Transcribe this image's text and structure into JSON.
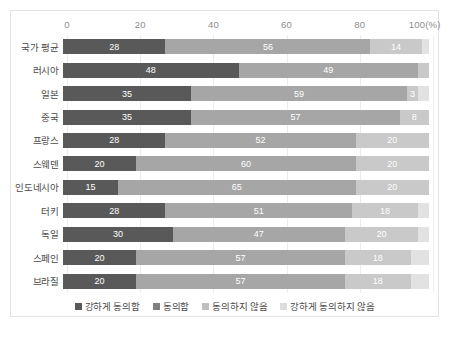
{
  "chart_data": {
    "type": "bar",
    "subtype": "stacked-horizontal-100",
    "title": "",
    "xlabel": "",
    "ylabel": "",
    "xlim": [
      0,
      100
    ],
    "ticks": [
      "0",
      "20",
      "40",
      "60",
      "80",
      "100(%)"
    ],
    "tick_values": [
      0,
      20,
      40,
      60,
      80,
      100
    ],
    "grid": true,
    "legend_position": "bottom",
    "categories": [
      "국가 평균",
      "러시아",
      "일본",
      "중국",
      "프랑스",
      "스웨덴",
      "인도네시아",
      "터키",
      "독일",
      "스페인",
      "브라질"
    ],
    "series": [
      {
        "name": "강하게 동의함",
        "color": "#595959",
        "values": [
          28,
          48,
          35,
          35,
          28,
          20,
          15,
          28,
          30,
          20,
          20
        ]
      },
      {
        "name": "동의함",
        "color": "#a6a6a6",
        "values": [
          56,
          49,
          59,
          57,
          52,
          60,
          65,
          51,
          47,
          57,
          57
        ]
      },
      {
        "name": "동의하지 않음",
        "color": "#c9c9c9",
        "values": [
          14,
          3,
          3,
          8,
          20,
          20,
          20,
          18,
          20,
          18,
          18
        ]
      },
      {
        "name": "강하게 동의하지 않음",
        "color": "#e2e2e2",
        "values": [
          2,
          0,
          3,
          0,
          0,
          0,
          0,
          3,
          3,
          5,
          5
        ]
      }
    ],
    "value_labels": [
      [
        "28",
        "56",
        "14",
        ""
      ],
      [
        "48",
        "49",
        "",
        ""
      ],
      [
        "35",
        "59",
        "3",
        ""
      ],
      [
        "35",
        "57",
        "8",
        ""
      ],
      [
        "28",
        "52",
        "20",
        ""
      ],
      [
        "20",
        "60",
        "20",
        ""
      ],
      [
        "15",
        "65",
        "20",
        ""
      ],
      [
        "28",
        "51",
        "18",
        ""
      ],
      [
        "30",
        "47",
        "20",
        ""
      ],
      [
        "20",
        "57",
        "18",
        ""
      ],
      [
        "20",
        "57",
        "18",
        ""
      ]
    ]
  },
  "legend": {
    "items": [
      {
        "label": "강하게 동의함"
      },
      {
        "label": "동의함"
      },
      {
        "label": "동의하지 않음"
      },
      {
        "label": "강하게 동의하지 않음"
      }
    ]
  }
}
